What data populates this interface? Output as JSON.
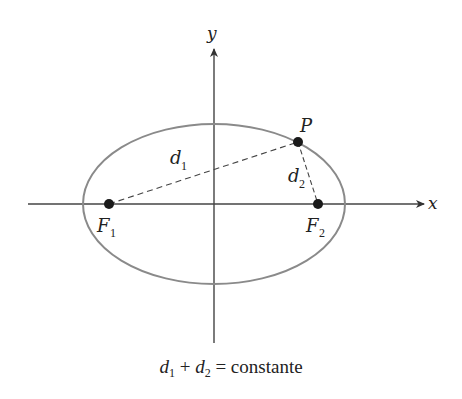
{
  "figure": {
    "type": "ellipse-definition",
    "axes": {
      "x_label": "x",
      "y_label": "y"
    },
    "ellipse": {
      "center_px": [
        214,
        204
      ],
      "rx_px": 131,
      "ry_px": 80,
      "stroke_color": "#8a8a8a"
    },
    "points": {
      "F1": {
        "label": "F",
        "subscript": "1",
        "px": [
          109,
          204
        ]
      },
      "F2": {
        "label": "F",
        "subscript": "2",
        "px": [
          318,
          204
        ]
      },
      "P": {
        "label": "P",
        "px": [
          298,
          142
        ]
      }
    },
    "segments": {
      "d1": {
        "label": "d",
        "subscript": "1",
        "from": "F1",
        "to": "P",
        "style": "dashed"
      },
      "d2": {
        "label": "d",
        "subscript": "2",
        "from": "P",
        "to": "F2",
        "style": "dashed"
      }
    },
    "caption": {
      "d1": "d",
      "d1_sub": "1",
      "plus": "+",
      "d2": "d",
      "d2_sub": "2",
      "equals_text": "= constante"
    }
  }
}
